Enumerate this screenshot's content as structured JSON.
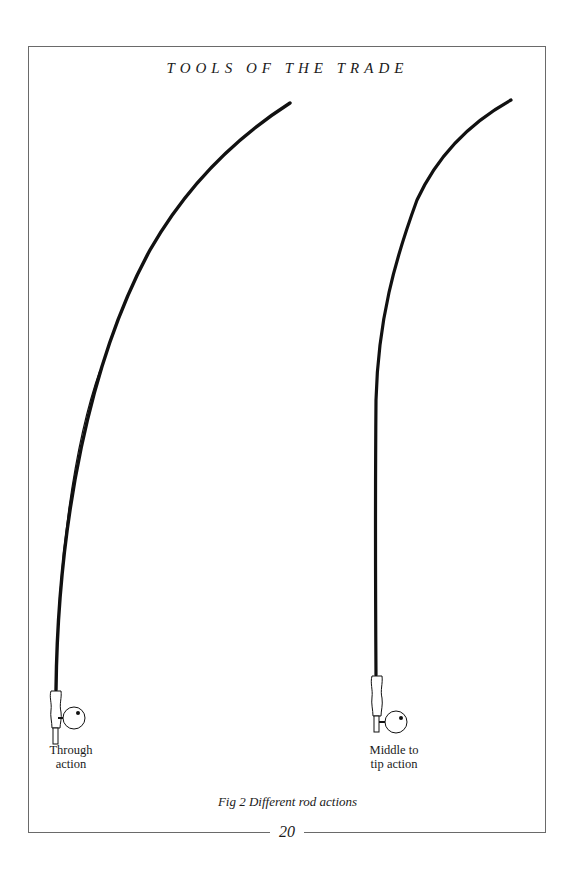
{
  "page": {
    "running_head": "TOOLS OF THE TRADE",
    "page_number": "20"
  },
  "figure": {
    "caption": "Fig 2 Different rod actions",
    "rods": [
      {
        "label_line1": "Through",
        "label_line2": "action",
        "icon": "fly-rod-through-action"
      },
      {
        "label_line1": "Middle to",
        "label_line2": "tip action",
        "icon": "fly-rod-middle-to-tip-action"
      }
    ]
  },
  "colors": {
    "ink": "#111111",
    "rule": "#6a6a6a",
    "paper": "#ffffff"
  }
}
